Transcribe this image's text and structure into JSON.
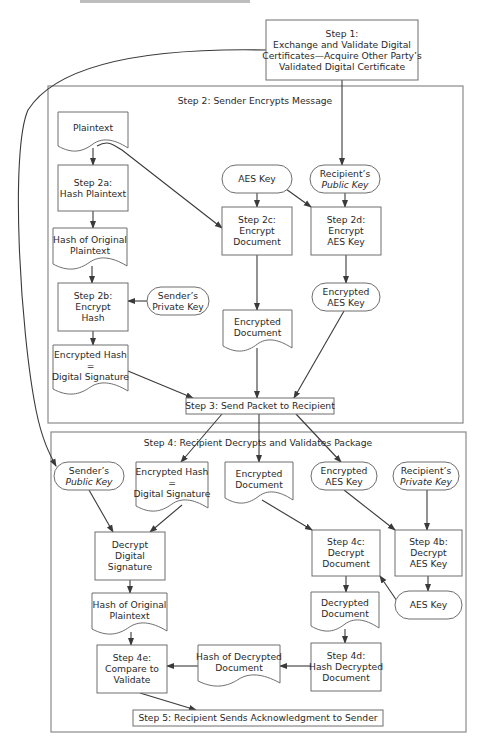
{
  "header": {
    "cut_off_caption": "INFORMATION SECURITY"
  },
  "colors": {
    "line": "#3a3a3a",
    "frame": "#8a8a8a",
    "box_border": "#6e6e6e",
    "text": "#2a2a2a",
    "background": "#ffffff"
  },
  "step1": {
    "lines": [
      "Step 1:",
      "Exchange and Validate Digital",
      "Certificates—Acquire Other Party’s",
      "Validated Digital Certificate"
    ]
  },
  "step2": {
    "title": "Step 2: Sender Encrypts Message",
    "nodes": {
      "plaintext": {
        "type": "document",
        "lines": [
          "Plaintext"
        ]
      },
      "step2a": {
        "type": "process",
        "lines": [
          "Step 2a:",
          "Hash Plaintext"
        ]
      },
      "hash_original": {
        "type": "document",
        "lines": [
          "Hash of Original",
          "Plaintext"
        ]
      },
      "step2b": {
        "type": "process",
        "lines": [
          "Step 2b:",
          "Encrypt",
          "Hash"
        ]
      },
      "sender_private_key": {
        "type": "terminator",
        "lines": [
          "Sender’s",
          "Private Key"
        ]
      },
      "encrypted_hash": {
        "type": "document",
        "lines": [
          "Encrypted Hash",
          "=",
          "Digital Signature"
        ]
      },
      "aes_key": {
        "type": "terminator",
        "lines": [
          "AES Key"
        ]
      },
      "recipient_public_key": {
        "type": "terminator",
        "lines": [
          "Recipient’s",
          "Public Key"
        ],
        "italic_line": 1
      },
      "step2c": {
        "type": "process",
        "lines": [
          "Step 2c:",
          "Encrypt",
          "Document"
        ]
      },
      "step2d": {
        "type": "process",
        "lines": [
          "Step 2d:",
          "Encrypt",
          "AES Key"
        ]
      },
      "encrypted_aes_key": {
        "type": "terminator",
        "lines": [
          "Encrypted",
          "AES Key"
        ]
      },
      "encrypted_document": {
        "type": "document",
        "lines": [
          "Encrypted",
          "Document"
        ]
      }
    }
  },
  "step3": {
    "lines": [
      "Step 3: Send Packet to Recipient"
    ]
  },
  "step4": {
    "title": "Step 4: Recipient Decrypts and Validates Package",
    "nodes": {
      "sender_public_key": {
        "type": "terminator",
        "lines": [
          "Sender’s",
          "Public Key"
        ],
        "italic_line": 1
      },
      "encrypted_hash": {
        "type": "document",
        "lines": [
          "Encrypted Hash",
          "=",
          "Digital Signature"
        ]
      },
      "encrypted_document": {
        "type": "document",
        "lines": [
          "Encrypted",
          "Document"
        ]
      },
      "encrypted_aes_key": {
        "type": "terminator",
        "lines": [
          "Encrypted",
          "AES Key"
        ]
      },
      "recipient_private_key": {
        "type": "terminator",
        "lines": [
          "Recipient’s",
          "Private Key"
        ],
        "italic_line": 1
      },
      "decrypt_signature": {
        "type": "process",
        "lines": [
          "Decrypt",
          "Digital",
          "Signature"
        ]
      },
      "step4c": {
        "type": "process",
        "lines": [
          "Step 4c:",
          "Decrypt",
          "Document"
        ]
      },
      "step4b": {
        "type": "process",
        "lines": [
          "Step 4b:",
          "Decrypt",
          "AES Key"
        ]
      },
      "hash_original": {
        "type": "document",
        "lines": [
          "Hash of Original",
          "Plaintext"
        ]
      },
      "decrypted_document": {
        "type": "document",
        "lines": [
          "Decrypted",
          "Document"
        ]
      },
      "aes_key": {
        "type": "terminator",
        "lines": [
          "AES Key"
        ]
      },
      "step4e": {
        "type": "process",
        "lines": [
          "Step 4e:",
          "Compare to",
          "Validate"
        ]
      },
      "hash_decrypted": {
        "type": "document",
        "lines": [
          "Hash of Decrypted",
          "Document"
        ]
      },
      "step4d": {
        "type": "process",
        "lines": [
          "Step 4d:",
          "Hash Decrypted",
          "Document"
        ]
      }
    }
  },
  "step5": {
    "lines": [
      "Step 5: Recipient Sends Acknowledgment to Sender"
    ]
  }
}
